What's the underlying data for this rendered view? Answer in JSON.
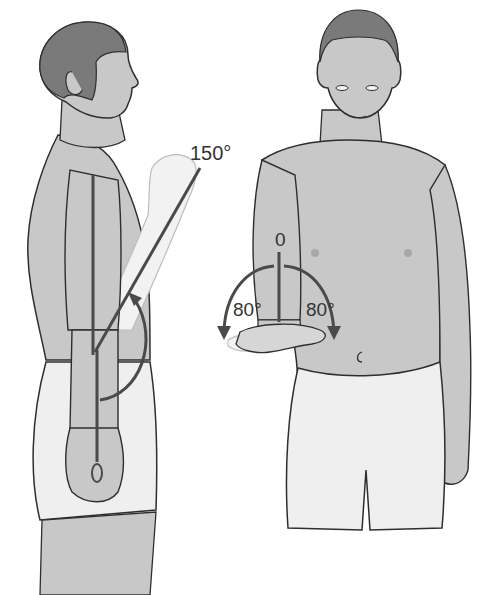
{
  "figure": {
    "colors": {
      "skin": "#c8c8c8",
      "skin_light": "#d6d6d6",
      "hair": "#7a7a7a",
      "shorts": "#efefef",
      "outline": "#2e2e2e",
      "measure_line": "#4a4a4a",
      "ghost_limb": "#f2f2f2",
      "background": "#ffffff"
    },
    "left_panel": {
      "view": "side",
      "movement": "elbow flexion",
      "labels": {
        "start_angle": "0",
        "end_angle": "150°"
      }
    },
    "right_panel": {
      "view": "front",
      "movement": "forearm pronation / supination",
      "labels": {
        "neutral": "0",
        "pronation": "80°",
        "supination": "80°"
      }
    }
  }
}
